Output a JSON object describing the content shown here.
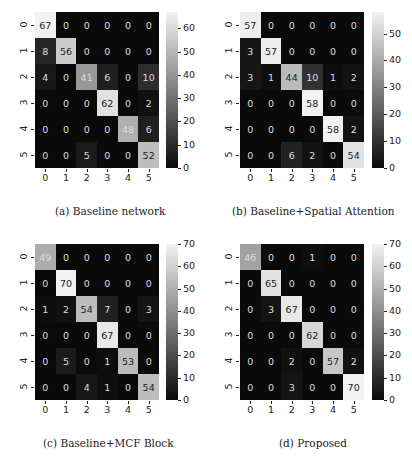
{
  "chart_data": [
    {
      "type": "heatmap",
      "title": "(a) Baseline network",
      "xlabel": "",
      "ylabel": "",
      "x_ticks": [
        "0",
        "1",
        "2",
        "3",
        "4",
        "5"
      ],
      "y_ticks": [
        "0",
        "1",
        "2",
        "3",
        "4",
        "5"
      ],
      "matrix": [
        [
          67,
          0,
          0,
          0,
          0,
          0
        ],
        [
          8,
          56,
          0,
          0,
          0,
          0
        ],
        [
          4,
          0,
          41,
          6,
          0,
          10
        ],
        [
          0,
          0,
          0,
          62,
          0,
          2
        ],
        [
          0,
          0,
          0,
          0,
          48,
          6
        ],
        [
          0,
          0,
          5,
          0,
          0,
          52
        ]
      ],
      "colorbar": {
        "min": 0,
        "max": 67,
        "ticks": [
          0,
          10,
          20,
          30,
          40,
          50,
          60
        ]
      },
      "colormap": "gray"
    },
    {
      "type": "heatmap",
      "title": "(b) Baseline+Spatial Attention",
      "xlabel": "",
      "ylabel": "",
      "x_ticks": [
        "0",
        "1",
        "2",
        "3",
        "4",
        "5"
      ],
      "y_ticks": [
        "0",
        "1",
        "2",
        "3",
        "4",
        "5"
      ],
      "matrix": [
        [
          57,
          0,
          0,
          0,
          0,
          0
        ],
        [
          3,
          57,
          0,
          0,
          0,
          0
        ],
        [
          3,
          1,
          44,
          10,
          1,
          2
        ],
        [
          0,
          0,
          0,
          58,
          0,
          0
        ],
        [
          0,
          0,
          0,
          0,
          58,
          2
        ],
        [
          0,
          0,
          6,
          2,
          0,
          54
        ]
      ],
      "colorbar": {
        "min": 0,
        "max": 58,
        "ticks": [
          0,
          10,
          20,
          30,
          40,
          50
        ]
      },
      "colormap": "gray"
    },
    {
      "type": "heatmap",
      "title": "(c) Baseline+MCF Block",
      "xlabel": "",
      "ylabel": "",
      "x_ticks": [
        "0",
        "1",
        "2",
        "3",
        "4",
        "5"
      ],
      "y_ticks": [
        "0",
        "1",
        "2",
        "3",
        "4",
        "5"
      ],
      "matrix": [
        [
          49,
          0,
          0,
          0,
          0,
          0
        ],
        [
          0,
          70,
          0,
          0,
          0,
          0
        ],
        [
          1,
          2,
          54,
          7,
          0,
          3
        ],
        [
          0,
          0,
          0,
          67,
          0,
          0
        ],
        [
          0,
          5,
          0,
          1,
          53,
          0
        ],
        [
          0,
          0,
          4,
          1,
          0,
          54
        ]
      ],
      "colorbar": {
        "min": 0,
        "max": 70,
        "ticks": [
          0,
          10,
          20,
          30,
          40,
          50,
          60,
          70
        ]
      },
      "colormap": "gray"
    },
    {
      "type": "heatmap",
      "title": "(d) Proposed",
      "xlabel": "",
      "ylabel": "",
      "x_ticks": [
        "0",
        "1",
        "2",
        "3",
        "4",
        "5"
      ],
      "y_ticks": [
        "0",
        "1",
        "2",
        "3",
        "4",
        "5"
      ],
      "matrix": [
        [
          46,
          0,
          0,
          1,
          0,
          0
        ],
        [
          0,
          65,
          0,
          0,
          0,
          0
        ],
        [
          0,
          3,
          67,
          0,
          0,
          0
        ],
        [
          0,
          0,
          0,
          62,
          0,
          0
        ],
        [
          0,
          0,
          2,
          0,
          57,
          2
        ],
        [
          0,
          0,
          3,
          0,
          0,
          70
        ]
      ],
      "colorbar": {
        "min": 0,
        "max": 70,
        "ticks": [
          0,
          10,
          20,
          30,
          40,
          50,
          60,
          70
        ]
      },
      "colormap": "gray"
    }
  ],
  "captions": {
    "a": "(a) Baseline network",
    "b": "(b) Baseline+Spatial Attention",
    "c": "(c) Baseline+MCF Block",
    "d": "(d) Proposed"
  },
  "layout": {
    "panels": [
      {
        "grid": [
          35,
          12,
          124,
          156
        ],
        "cbar": [
          166,
          12,
          12,
          156
        ],
        "caption_x": 55,
        "caption_y": 205
      },
      {
        "grid": [
          240,
          12,
          124,
          156
        ],
        "cbar": [
          372,
          12,
          12,
          156
        ],
        "caption_x": 232,
        "caption_y": 205
      },
      {
        "grid": [
          35,
          244,
          124,
          156
        ],
        "cbar": [
          166,
          244,
          12,
          156
        ],
        "caption_x": 43,
        "caption_y": 437
      },
      {
        "grid": [
          240,
          244,
          124,
          156
        ],
        "cbar": [
          372,
          244,
          12,
          156
        ],
        "caption_x": 279,
        "caption_y": 437
      }
    ]
  }
}
